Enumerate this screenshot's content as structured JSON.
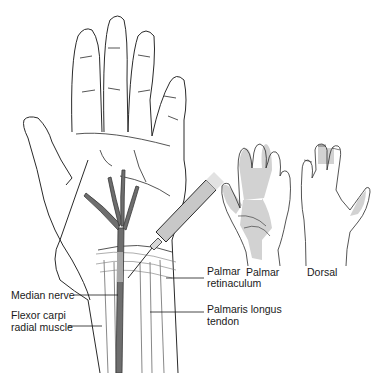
{
  "labels": {
    "median_nerve": "Median nerve",
    "flexor_line1": "Flexor carpi",
    "flexor_line2": "radial muscle",
    "palmar_ret_line1": "Palmar",
    "palmar_ret_line2": "retinaculum",
    "palmaris_line1": "Palmaris longus",
    "palmaris_line2": "tendon",
    "inset_palmar": "Palmar",
    "inset_dorsal": "Dorsal"
  },
  "colors": {
    "line": "#2a2a2a",
    "nerve": "#6e6e6e",
    "shade": "#d2d2d2",
    "needle_body": "#c8c8c8"
  }
}
